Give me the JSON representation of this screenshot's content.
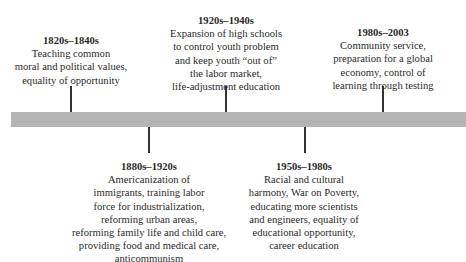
{
  "timeline": {
    "bar_color": "#b4b4b4",
    "events": [
      {
        "period": "1820s–1840s",
        "description": "Teaching common\nmoral and political values,\nequality of opportunity",
        "position": "above"
      },
      {
        "period": "1880s–1920s",
        "description": "Americanization of\nimmigrants, training labor\nforce for industrialization,\nreforming urban areas,\nreforming family life and child care,\nproviding food and medical care,\nanticommunism",
        "position": "below"
      },
      {
        "period": "1920s–1940s",
        "description": "Expansion of high schools\nto control youth problem\nand keep youth “out of”\nthe labor market,\nlife-adjustment education",
        "position": "above"
      },
      {
        "period": "1950s–1980s",
        "description": "Racial and cultural\nharmony, War on Poverty,\neducating more scientists\nand engineers, equality of\neducational opportunity,\ncareer education",
        "position": "below"
      },
      {
        "period": "1980s–2003",
        "description": "Community service,\npreparation for a global\neconomy, control of\nlearning through testing",
        "position": "above"
      }
    ]
  }
}
